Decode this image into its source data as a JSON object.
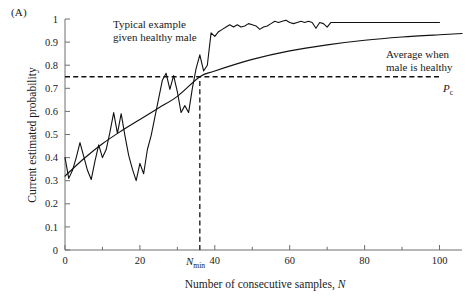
{
  "panel": {
    "label": "(A)"
  },
  "chart_data": {
    "type": "line",
    "title": "",
    "xlabel_main": "Number of consecutive samples, ",
    "xlabel_italic": "N",
    "ylabel": "Current estimated probability",
    "xlim": [
      0,
      106
    ],
    "ylim": [
      0,
      1
    ],
    "xticks": [
      0,
      20,
      40,
      60,
      80,
      100
    ],
    "xtick_labels": [
      "0",
      "20",
      "40",
      "60",
      "80",
      "100"
    ],
    "xminor_ticks": [
      10,
      30,
      50,
      70,
      90
    ],
    "yticks": [
      0,
      0.1,
      0.2,
      0.3,
      0.4,
      0.5,
      0.6,
      0.7,
      0.8,
      0.9,
      1
    ],
    "ytick_labels": [
      "0",
      "0.1",
      "0.2",
      "0.3",
      "0.4",
      "0.5",
      "0.6",
      "0.7",
      "0.8",
      "0.9",
      "1"
    ],
    "grid": false,
    "legend_position": "inline-annotations",
    "series": [
      {
        "name": "Typical example given healthy male",
        "style": "noisy",
        "x": [
          0,
          1,
          2,
          3,
          4,
          5,
          6,
          7,
          8,
          9,
          10,
          11,
          12,
          13,
          14,
          15,
          16,
          17,
          18,
          19,
          20,
          21,
          22,
          23,
          24,
          25,
          26,
          27,
          28,
          29,
          30,
          31,
          32,
          33,
          34,
          35,
          36,
          37,
          38,
          39,
          40,
          41,
          42,
          43,
          44,
          45,
          46,
          47,
          48,
          49,
          50,
          51,
          52,
          53,
          54,
          55,
          56,
          57,
          58,
          59,
          60,
          61,
          62,
          63,
          64,
          65,
          66,
          67,
          68,
          69,
          70,
          71,
          72,
          76,
          82,
          90,
          100
        ],
        "values": [
          0.4,
          0.31,
          0.345,
          0.4,
          0.465,
          0.405,
          0.345,
          0.305,
          0.385,
          0.455,
          0.4,
          0.435,
          0.51,
          0.595,
          0.505,
          0.59,
          0.495,
          0.41,
          0.35,
          0.3,
          0.375,
          0.33,
          0.435,
          0.495,
          0.575,
          0.655,
          0.735,
          0.765,
          0.695,
          0.755,
          0.685,
          0.595,
          0.625,
          0.595,
          0.7,
          0.785,
          0.845,
          0.775,
          0.8,
          0.94,
          0.925,
          0.945,
          0.955,
          0.965,
          0.975,
          0.965,
          0.975,
          0.965,
          0.97,
          0.98,
          0.975,
          0.97,
          0.955,
          0.965,
          0.97,
          0.98,
          0.99,
          0.985,
          0.99,
          0.995,
          0.985,
          0.98,
          0.985,
          0.99,
          0.985,
          0.99,
          0.985,
          0.96,
          0.985,
          0.98,
          0.965,
          0.985,
          0.985,
          0.985,
          0.985,
          0.985,
          0.985
        ]
      },
      {
        "name": "Average when male is healthy",
        "style": "smooth",
        "x": [
          0,
          5,
          10,
          15,
          20,
          25,
          30,
          36,
          40,
          50,
          60,
          70,
          80,
          90,
          100,
          106
        ],
        "values": [
          0.32,
          0.395,
          0.46,
          0.515,
          0.565,
          0.615,
          0.665,
          0.75,
          0.775,
          0.825,
          0.862,
          0.888,
          0.908,
          0.922,
          0.932,
          0.937
        ]
      }
    ],
    "reference_lines": [
      {
        "name": "critical-probability",
        "orientation": "horizontal",
        "value": 0.75,
        "label": "P",
        "label_subscript": "c",
        "style": "dashed"
      },
      {
        "name": "minimum-samples",
        "orientation": "vertical",
        "value": 36,
        "label": "N",
        "label_subscript": "min",
        "style": "dashed"
      }
    ],
    "annotations": [
      {
        "name": "typical-example-annotation",
        "line1": "Typical example",
        "line2": "given healthy male"
      },
      {
        "name": "average-annotation",
        "line1": "Average when",
        "line2": "male is healthy"
      }
    ]
  },
  "colors": {
    "background": "#ffffff",
    "curve": "#111111",
    "axis": "#6e6e6e",
    "text": "#1a1a1a"
  }
}
